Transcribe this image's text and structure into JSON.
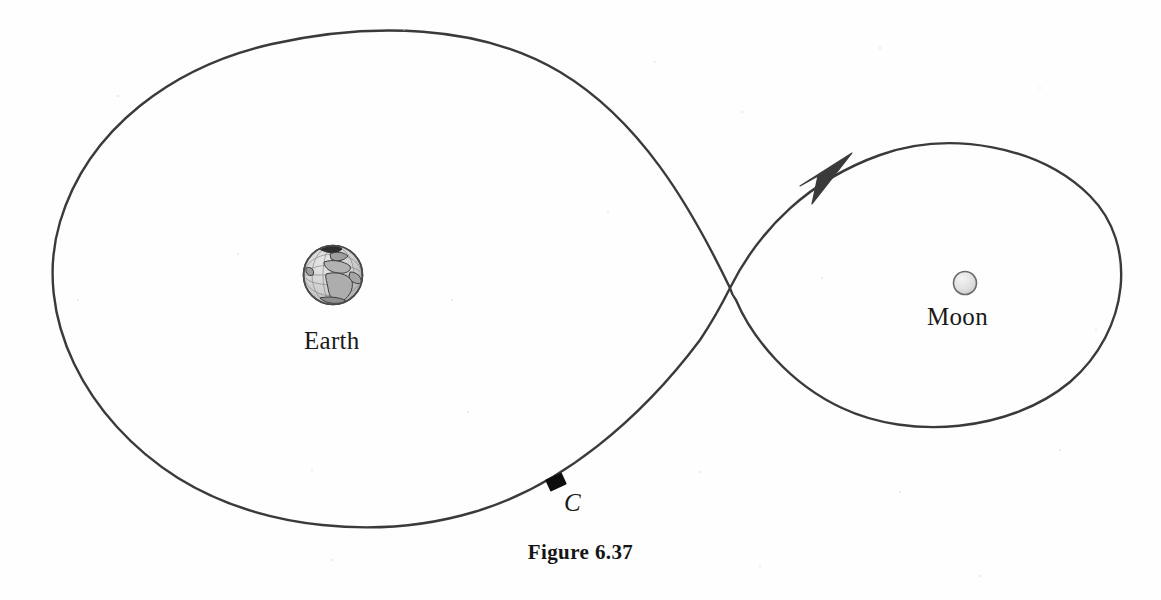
{
  "figure": {
    "caption": "Figure 6.37",
    "bodies": [
      {
        "name": "earth",
        "label": "Earth",
        "icon": "earth-globe-icon",
        "cx": 333,
        "cy": 275,
        "r": 29.5
      },
      {
        "name": "moon",
        "label": "Moon",
        "icon": "moon-sphere-icon",
        "cx": 965,
        "cy": 283,
        "r": 11.5
      }
    ],
    "markers": [
      {
        "name": "spacecraft",
        "label": "C",
        "icon": "spacecraft-square-marker",
        "x": 556,
        "y": 482,
        "rotation_deg": -25,
        "width": 18,
        "height": 13
      }
    ],
    "trajectory": {
      "name": "figure-eight-trajectory",
      "crossing_point": {
        "x": 730,
        "y": 288
      },
      "left_loop": {
        "extent_left": 56,
        "extent_right": 730,
        "extent_top": 33,
        "extent_bottom": 528
      },
      "right_loop": {
        "extent_left": 730,
        "extent_right": 1125,
        "extent_top": 145,
        "extent_bottom": 427
      },
      "direction_arrow": {
        "name": "direction-arrowhead",
        "x": 828,
        "y": 165,
        "points": "clockwise-into-moon-loop"
      }
    },
    "colors": {
      "background": "#fefefe",
      "curve": "#3a3a3a",
      "ink": "#1a1a1a",
      "earth_land": "#b9b9b9",
      "earth_ocean": "#d8d8d8",
      "moon_fill": "#dcdcdc",
      "marker_fill": "#0d0d0d"
    }
  }
}
